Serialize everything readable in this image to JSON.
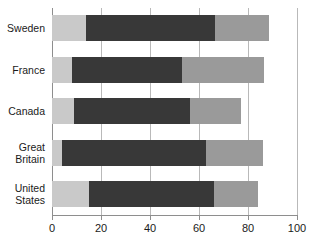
{
  "chart_data": {
    "type": "bar",
    "orientation": "horizontal",
    "stacked": true,
    "title": "",
    "subtitle": "",
    "xlabel": "",
    "ylabel": "",
    "xlim": [
      0,
      100
    ],
    "grid": true,
    "legend": "none",
    "xticks": [
      0,
      20,
      40,
      60,
      80,
      100
    ],
    "xtick_labels": [
      "0",
      "20",
      "40",
      "60",
      "80",
      "100"
    ],
    "categories": [
      "Sweden",
      "France",
      "Canada",
      "Great\nBritain",
      "United\nStates"
    ],
    "series": [
      {
        "name": "light-gray-segment",
        "color": "#c9c9c9",
        "values": [
          14,
          8,
          9,
          4,
          15
        ]
      },
      {
        "name": "dark-gray-segment",
        "color": "#383838",
        "values": [
          52.5,
          45,
          47.5,
          59,
          51
        ]
      },
      {
        "name": "medium-gray-segment",
        "color": "#9a9a9a",
        "values": [
          22,
          33.5,
          20.5,
          23,
          18
        ]
      }
    ],
    "cumulative_ends": [
      {
        "category": "Sweden",
        "light_end": 14,
        "dark_end": 66.5,
        "total": 88.5
      },
      {
        "category": "France",
        "light_end": 8,
        "dark_end": 53,
        "total": 86.5
      },
      {
        "category": "Canada",
        "light_end": 9,
        "dark_end": 56.5,
        "total": 77
      },
      {
        "category": "Great Britain",
        "light_end": 4,
        "dark_end": 63,
        "total": 86
      },
      {
        "category": "United States",
        "light_end": 15,
        "dark_end": 66,
        "total": 84
      }
    ]
  },
  "colors": {
    "light": "#c9c9c9",
    "dark": "#383838",
    "medium": "#9a9a9a",
    "grid": "#b9b9b9",
    "axis": "#8e8e8e",
    "text": "#1a1a1a",
    "background": "#ffffff"
  }
}
